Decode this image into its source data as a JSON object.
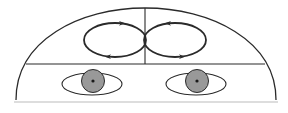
{
  "diagram": {
    "title": "",
    "colors": {
      "stroke": "#2a2a2a",
      "iris": "#999999",
      "pupil": "#1a1a1a",
      "background": "#ffffff",
      "baseline": "#bbbbbb"
    },
    "elements": {
      "head_outline": "dome",
      "divider_horizontal": "forehead-eye boundary",
      "divider_vertical": "midline",
      "loops": [
        {
          "side": "left",
          "direction": "clockwise-arrows",
          "arrows": [
            "top-right",
            "bottom-left"
          ]
        },
        {
          "side": "right",
          "direction": "counterclockwise-arrows",
          "arrows": [
            "top-left",
            "bottom-right"
          ]
        }
      ],
      "eyes": [
        {
          "side": "left"
        },
        {
          "side": "right"
        }
      ]
    }
  }
}
